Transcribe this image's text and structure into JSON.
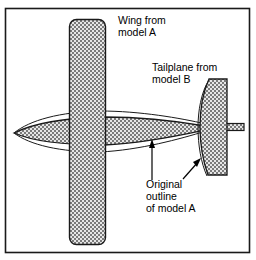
{
  "figure": {
    "frame": {
      "stroke": "#1a1a1a",
      "fill": "#ffffff",
      "x": 5,
      "y": 8,
      "width": 245,
      "height": 245
    },
    "palette": {
      "outline": "#1a1a1a",
      "hatch_dark": "#5a5a5a",
      "hatch_light": "#d8d8d8",
      "text": "#000000",
      "background": "#ffffff"
    }
  },
  "annotations": [
    {
      "id": "wing-label",
      "name": "wing-from-model-a",
      "lines": [
        "Wing from",
        "model A"
      ],
      "x": 118,
      "y": 24,
      "line_height": 12
    },
    {
      "id": "tailplane-label",
      "name": "tailplane-from-model-b",
      "lines": [
        "Tailplane from",
        "model B"
      ],
      "x": 152,
      "y": 71,
      "line_height": 12
    },
    {
      "id": "original-outline-label",
      "name": "original-outline-of-model-a",
      "lines": [
        "Original",
        "outline",
        "of model A"
      ],
      "x": 146,
      "y": 188,
      "line_height": 12
    }
  ],
  "leaders": [
    {
      "id": "leader-fuselage",
      "name": "leader-to-fuselage-outline",
      "type": "arrow",
      "from": [
        152,
        180
      ],
      "to": [
        152,
        141
      ]
    },
    {
      "id": "leader-tailplane",
      "name": "leader-to-tailplane-outline",
      "type": "arrow",
      "from": [
        183,
        178
      ],
      "to": [
        200,
        160
      ]
    }
  ],
  "parts": [
    {
      "id": "wing",
      "name": "wing-panel-model-a",
      "description": "Vertical rounded rectangle representing the wing planform from model A",
      "bounds": {
        "x": 69,
        "y": 19,
        "width": 37,
        "height": 226
      },
      "corner_radius": 7,
      "fill": "hatch"
    },
    {
      "id": "fuselage",
      "name": "fuselage-model-a",
      "description": "Horizontal lens shaped fuselage, nose at left, tapering to the tail at right",
      "nose": [
        14,
        133
      ],
      "tail": [
        205,
        127
      ],
      "fill": "hatch"
    },
    {
      "id": "fuselage-original-outline",
      "name": "original-fuselage-outline",
      "description": "Thin unfilled outline of the larger original model A fuselage",
      "stroke_width": 1
    },
    {
      "id": "tailplane",
      "name": "tailplane-model-b",
      "description": "Vertical tail surface from model B, slightly tapered with curved leading edge",
      "bounds": {
        "x": 203,
        "y": 79,
        "width": 24,
        "height": 96
      },
      "fill": "hatch"
    },
    {
      "id": "tail-boom",
      "name": "tail-boom-stabiliser",
      "description": "Thin horizontal bar extending right of the tailplane",
      "bounds": {
        "x": 206,
        "y": 123,
        "width": 38,
        "height": 7
      },
      "fill": "hatch"
    },
    {
      "id": "tailplane-original-outline",
      "name": "original-tailplane-outline",
      "description": "Thin curved outline of the original model A tail surface",
      "stroke_width": 1
    }
  ]
}
